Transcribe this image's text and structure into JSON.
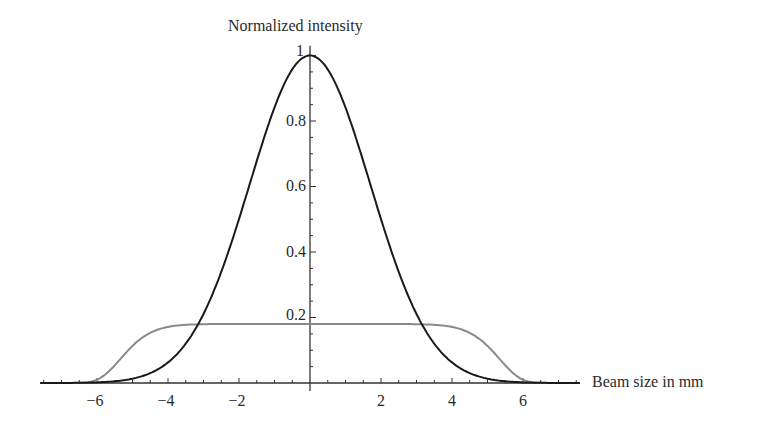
{
  "chart_data": {
    "type": "line",
    "title": "",
    "xlabel": "Beam size in mm",
    "ylabel": "Normalized intensity",
    "xlim": [
      -7.6,
      7.6
    ],
    "ylim": [
      0,
      1.0
    ],
    "grid": false,
    "legend": null,
    "x_ticks": [
      -6,
      -4,
      -2,
      2,
      4,
      6
    ],
    "x_tick_labels": [
      "−6",
      "−4",
      "−2",
      "2",
      "4",
      "6"
    ],
    "y_ticks": [
      0.2,
      0.4,
      0.6,
      0.8,
      1
    ],
    "y_tick_labels": [
      "0.2",
      "0.4",
      "0.6",
      "0.8",
      "1"
    ],
    "x": [
      -7,
      -6,
      -5,
      -4,
      -3,
      -2,
      -1,
      0,
      1,
      2,
      3,
      4,
      5,
      6,
      7
    ],
    "series": [
      {
        "name": "Gaussian beam profile",
        "color": "#1a1a1a",
        "values": [
          0.0,
          0.002,
          0.013,
          0.063,
          0.211,
          0.5,
          0.841,
          1.0,
          0.841,
          0.5,
          0.211,
          0.063,
          0.013,
          0.002,
          0.0
        ]
      },
      {
        "name": "Flat-top beam profile",
        "color": "#8a8a8a",
        "values": [
          0.0,
          0.01,
          0.114,
          0.171,
          0.18,
          0.18,
          0.18,
          0.18,
          0.18,
          0.18,
          0.18,
          0.171,
          0.114,
          0.01,
          0.0
        ]
      }
    ],
    "model": {
      "gaussian": {
        "amplitude": 1.0,
        "sigma": 1.7
      },
      "flat_top": {
        "amplitude": 0.18,
        "width": 5.4,
        "order": 10
      }
    }
  },
  "axes": {
    "ylabel": "Normalized intensity",
    "xlabel": "Beam size in mm",
    "yticks": [
      "0.2",
      "0.4",
      "0.6",
      "0.8",
      "1"
    ],
    "xticks": [
      "−6",
      "−4",
      "−2",
      "2",
      "4",
      "6"
    ]
  }
}
